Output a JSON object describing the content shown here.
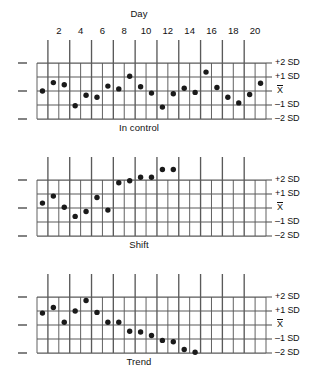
{
  "figure": {
    "top_axis_title": "Day",
    "day_ticks": [
      2,
      4,
      6,
      8,
      10,
      12,
      14,
      16,
      18,
      20
    ],
    "sd_labels": [
      "+2 SD",
      "+1 SD",
      "X̄",
      "–1 SD",
      "–2 SD"
    ],
    "center_label": "X",
    "line_color": "#5a5a5a",
    "point_color": "#1a1a1a",
    "text_color": "#111111",
    "background": "#ffffff"
  },
  "chart_data": [
    {
      "type": "scatter",
      "title": "In control",
      "xlabel": "Day",
      "ylabel": "",
      "xlim": [
        0.5,
        21.5
      ],
      "ylim": [
        -2,
        2
      ],
      "ytick_labels": [
        "+2 SD",
        "+1 SD",
        "X̄",
        "–1 SD",
        "–2 SD"
      ],
      "ytick_values": [
        2,
        1,
        0,
        -1,
        -2
      ],
      "xtick_labels": [
        "2",
        "4",
        "6",
        "8",
        "10",
        "12",
        "14",
        "16",
        "18",
        "20"
      ],
      "xtick_values": [
        2,
        4,
        6,
        8,
        10,
        12,
        14,
        16,
        18,
        20
      ],
      "grid": true,
      "x": [
        1,
        2,
        3,
        4,
        5,
        6,
        7,
        8,
        9,
        10,
        11,
        12,
        13,
        14,
        15,
        16,
        17,
        18,
        19,
        20,
        21
      ],
      "values": [
        0.0,
        0.6,
        0.45,
        -1.05,
        -0.3,
        -0.45,
        0.35,
        0.15,
        1.05,
        0.3,
        -0.15,
        -1.15,
        -0.2,
        0.2,
        -0.1,
        1.35,
        0.25,
        -0.45,
        -0.85,
        -0.25,
        0.55
      ]
    },
    {
      "type": "scatter",
      "title": "Shift",
      "xlabel": "Day",
      "ylabel": "",
      "xlim": [
        0.5,
        21.5
      ],
      "ylim": [
        -2,
        2
      ],
      "ytick_labels": [
        "+2 SD",
        "+1 SD",
        "X̄",
        "–1 SD",
        "–2 SD"
      ],
      "ytick_values": [
        2,
        1,
        0,
        -1,
        -2
      ],
      "xtick_labels": [
        "2",
        "4",
        "6",
        "8",
        "10",
        "12",
        "14",
        "16",
        "18",
        "20"
      ],
      "xtick_values": [
        2,
        4,
        6,
        8,
        10,
        12,
        14,
        16,
        18,
        20
      ],
      "grid": true,
      "x": [
        1,
        2,
        3,
        4,
        5,
        6,
        7,
        8,
        9,
        10,
        11,
        12,
        13
      ],
      "values": [
        0.35,
        0.85,
        0.05,
        -0.6,
        -0.25,
        0.75,
        -0.15,
        1.8,
        1.95,
        2.2,
        2.2,
        2.75,
        2.75
      ]
    },
    {
      "type": "scatter",
      "title": "Trend",
      "xlabel": "Day",
      "ylabel": "",
      "xlim": [
        0.5,
        21.5
      ],
      "ylim": [
        -2,
        2
      ],
      "ytick_labels": [
        "+2 SD",
        "+1 SD",
        "X̄",
        "–1 SD",
        "–2 SD"
      ],
      "ytick_values": [
        2,
        1,
        0,
        -1,
        -2
      ],
      "xtick_labels": [
        "2",
        "4",
        "6",
        "8",
        "10",
        "12",
        "14",
        "16",
        "18",
        "20"
      ],
      "xtick_values": [
        2,
        4,
        6,
        8,
        10,
        12,
        14,
        16,
        18,
        20
      ],
      "grid": true,
      "x": [
        1,
        2,
        3,
        4,
        5,
        6,
        7,
        8,
        9,
        10,
        11,
        12,
        13,
        14,
        15
      ],
      "values": [
        0.85,
        1.25,
        0.2,
        1.0,
        1.75,
        0.9,
        0.2,
        0.2,
        -0.45,
        -0.5,
        -0.75,
        -1.1,
        -1.2,
        -1.75,
        -1.95
      ]
    }
  ]
}
